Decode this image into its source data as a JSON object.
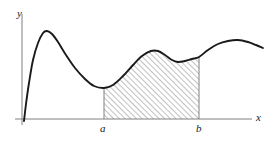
{
  "figure": {
    "background_color": "#ffffff",
    "curve_color": "#1a1a1a",
    "axis_color": "#808080",
    "hatch_color": "#8c8c8c"
  },
  "axes": {
    "y_axis": {
      "label": "y",
      "x_px": 22,
      "y_top_px": 14,
      "y_bottom_px": 125
    },
    "x_axis": {
      "label": "x",
      "y_px": 119,
      "x_left_px": 15,
      "x_right_px": 252
    }
  },
  "bounds": {
    "a": {
      "label": "a",
      "x_px": 104,
      "top_px": 88,
      "bottom_px": 119
    },
    "b": {
      "label": "b",
      "x_px": 199,
      "top_px": 57,
      "bottom_px": 119
    }
  },
  "chart_data": {
    "type": "line",
    "title": "",
    "xlabel": "x",
    "ylabel": "y",
    "grid": false,
    "legend": null,
    "shaded_region": {
      "fill": "hatch-diagonal",
      "from_label": "a",
      "to_label": "b",
      "from_x_px": 104,
      "to_x_px": 199
    },
    "curve_points_px": [
      [
        24,
        121
      ],
      [
        26,
        104
      ],
      [
        29,
        83
      ],
      [
        33,
        60
      ],
      [
        38,
        43
      ],
      [
        43,
        33
      ],
      [
        47,
        31
      ],
      [
        52,
        34
      ],
      [
        58,
        42
      ],
      [
        66,
        55
      ],
      [
        75,
        68
      ],
      [
        85,
        79
      ],
      [
        94,
        86
      ],
      [
        104,
        88
      ],
      [
        113,
        85
      ],
      [
        123,
        76
      ],
      [
        133,
        65
      ],
      [
        142,
        56
      ],
      [
        151,
        51
      ],
      [
        158,
        51
      ],
      [
        165,
        55
      ],
      [
        172,
        60
      ],
      [
        178,
        62
      ],
      [
        185,
        61
      ],
      [
        192,
        59
      ],
      [
        199,
        57
      ],
      [
        208,
        50
      ],
      [
        218,
        44
      ],
      [
        228,
        41
      ],
      [
        238,
        40
      ],
      [
        248,
        42
      ],
      [
        256,
        45
      ],
      [
        263,
        48
      ]
    ],
    "features": [
      {
        "name": "local maximum",
        "x_px": 47,
        "y_px": 31
      },
      {
        "name": "local minimum",
        "x_px": 104,
        "y_px": 88
      },
      {
        "name": "local maximum",
        "x_px": 155,
        "y_px": 51
      },
      {
        "name": "local minimum",
        "x_px": 179,
        "y_px": 62
      },
      {
        "name": "local maximum",
        "x_px": 234,
        "y_px": 40
      }
    ]
  }
}
